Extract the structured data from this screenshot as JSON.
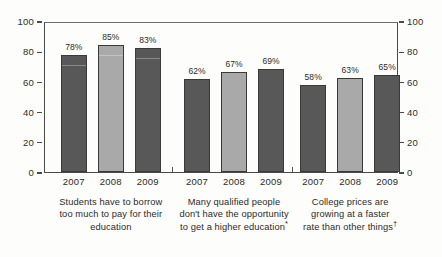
{
  "chart_data": {
    "type": "bar",
    "title": "",
    "subtitle": "",
    "xlabel": "",
    "ylabel": "",
    "ylim": [
      0,
      100
    ],
    "yticks": [
      0,
      20,
      40,
      60,
      80,
      100
    ],
    "grid": false,
    "legend": "none",
    "dual_axis": true,
    "categories": [
      "2007",
      "2008",
      "2009"
    ],
    "groups": [
      {
        "caption": "Students have to borrow too much to pay for their education",
        "caption_lines": [
          "Students have to borrow",
          "too much to pay for their",
          "education"
        ],
        "footnote_mark": "",
        "bars": [
          {
            "category": "2007",
            "value": 78,
            "label": "78%",
            "shade": "dark"
          },
          {
            "category": "2008",
            "value": 85,
            "label": "85%",
            "shade": "light"
          },
          {
            "category": "2009",
            "value": 83,
            "label": "83%",
            "shade": "dark"
          }
        ]
      },
      {
        "caption": "Many qualified people don't have the opportunity to get a higher education*",
        "caption_lines": [
          "Many qualified people",
          "don't have the opportunity",
          "to get a higher education"
        ],
        "footnote_mark": "*",
        "bars": [
          {
            "category": "2007",
            "value": 62,
            "label": "62%",
            "shade": "dark"
          },
          {
            "category": "2008",
            "value": 67,
            "label": "67%",
            "shade": "light"
          },
          {
            "category": "2009",
            "value": 69,
            "label": "69%",
            "shade": "dark"
          }
        ]
      },
      {
        "caption": "College prices are growing at a faster rate than other things†",
        "caption_lines": [
          "College prices are",
          "growing at a faster",
          "rate than other things"
        ],
        "footnote_mark": "†",
        "bars": [
          {
            "category": "2007",
            "value": 58,
            "label": "58%",
            "shade": "dark"
          },
          {
            "category": "2008",
            "value": 63,
            "label": "63%",
            "shade": "light"
          },
          {
            "category": "2009",
            "value": 65,
            "label": "65%",
            "shade": "dark"
          }
        ]
      }
    ],
    "colors": {
      "bar_dark": "#585858",
      "bar_light": "#a9a9a9",
      "bar_outline": "#3a3a3a",
      "axis": "#4a4a4a",
      "text": "#2b2b2b",
      "background": "#fdfdfb"
    }
  },
  "axes": {
    "left_ticks": [
      "100",
      "80",
      "60",
      "40",
      "20",
      "0"
    ],
    "right_ticks": [
      "100",
      "80",
      "60",
      "40",
      "20",
      "0"
    ]
  }
}
